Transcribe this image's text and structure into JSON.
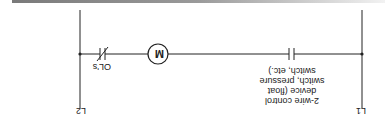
{
  "diagram": {
    "type": "ladder-diagram",
    "rails": {
      "left_label": "L1",
      "right_label": "L2"
    },
    "rung": {
      "elements": [
        {
          "type": "normally-open-contact",
          "label_lines": [
            "2-wire control",
            "device (float",
            "switch, pressure",
            "switch, etc.)"
          ]
        },
        {
          "type": "coil",
          "label": "M"
        },
        {
          "type": "normally-closed-contact",
          "label": "OL's"
        }
      ]
    },
    "orientation": "rotated-180",
    "colors": {
      "line": "#222222",
      "bar": "#8a8a8a"
    }
  }
}
